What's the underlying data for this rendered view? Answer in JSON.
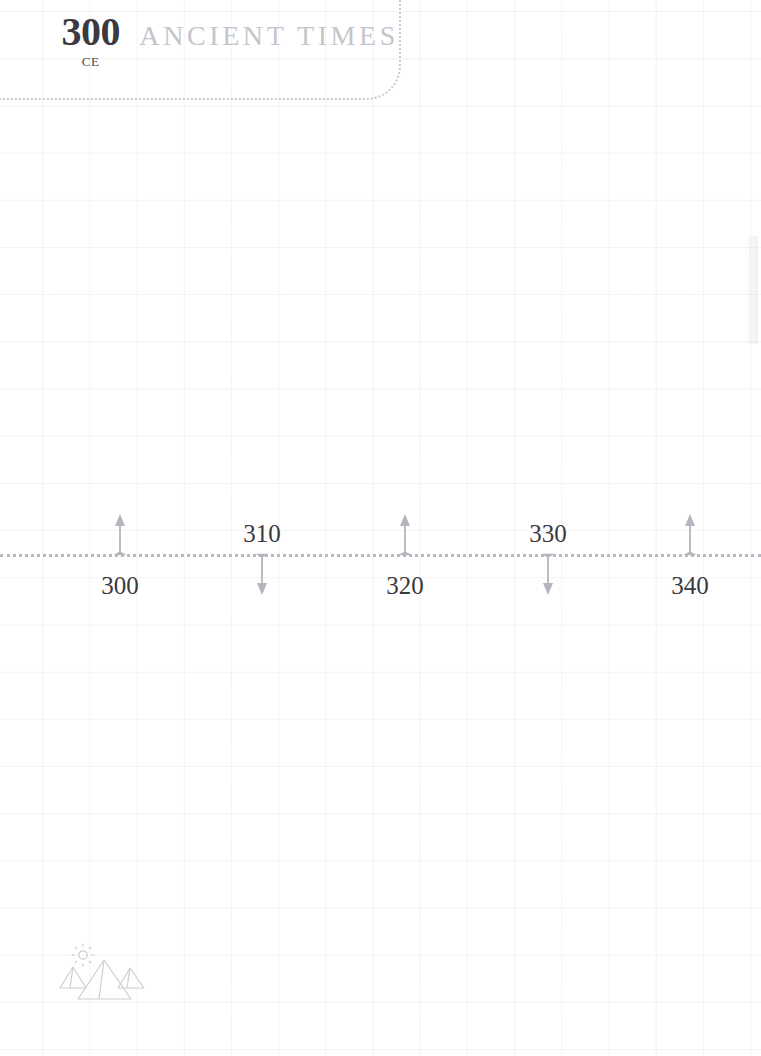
{
  "page": {
    "background_color": "#ffffff",
    "grid_line_color": "#dadade",
    "width": 761,
    "height": 1056
  },
  "header": {
    "year": "300",
    "era_suffix": "CE",
    "era_name": "ANCIENT TIMES",
    "year_color": "#3a3a40",
    "era_name_color": "#c5c5cc",
    "border_color": "#c9c9cf"
  },
  "timeline": {
    "axis_color": "#b9b9c2",
    "arrow_color": "#b5b5bd",
    "label_color": "#3a3a40",
    "ticks": [
      {
        "label": "300",
        "x": 120,
        "direction": "up",
        "label_position": "below"
      },
      {
        "label": "310",
        "x": 262,
        "direction": "down",
        "label_position": "above"
      },
      {
        "label": "320",
        "x": 405,
        "direction": "up",
        "label_position": "below"
      },
      {
        "label": "330",
        "x": 548,
        "direction": "down",
        "label_position": "above"
      },
      {
        "label": "340",
        "x": 690,
        "direction": "up",
        "label_position": "below"
      }
    ]
  },
  "footer": {
    "icon_name": "pyramids-sun-icon",
    "icon_color": "#cdcdd4"
  }
}
